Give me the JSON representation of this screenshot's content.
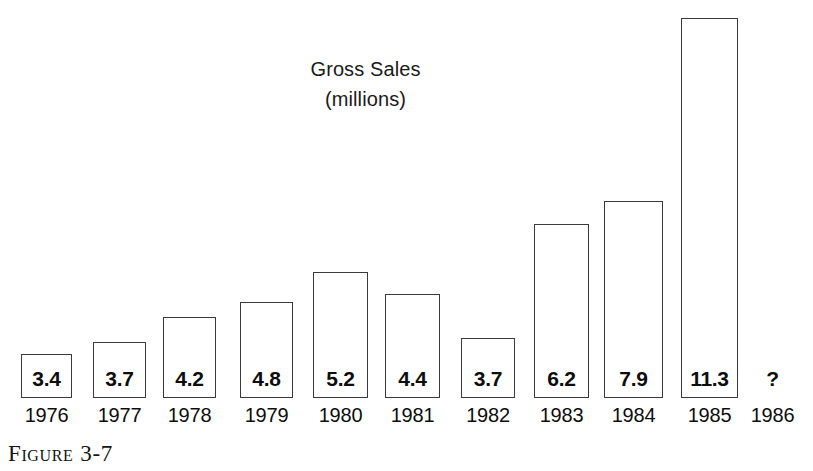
{
  "figure": {
    "caption_word": "Figure",
    "caption_number": "3-7"
  },
  "chart_data": {
    "type": "bar",
    "title": "Gross Sales",
    "subtitle": "(millions)",
    "xlabel": "",
    "ylabel": "",
    "ylim": [
      0,
      11.3
    ],
    "grid": false,
    "legend": null,
    "categories": [
      "1976",
      "1977",
      "1978",
      "1979",
      "1980",
      "1981",
      "1982",
      "1983",
      "1984",
      "1985",
      "1986"
    ],
    "values": [
      3.4,
      3.7,
      4.2,
      4.8,
      5.2,
      4.4,
      3.7,
      6.2,
      7.9,
      11.3,
      null
    ],
    "value_labels": [
      "3.4",
      "3.7",
      "4.2",
      "4.8",
      "5.2",
      "4.4",
      "3.7",
      "6.2",
      "7.9",
      "11.3",
      "?"
    ],
    "bars": [
      {
        "category": "1976",
        "value": 3.4,
        "label": "3.4",
        "x": 21,
        "width": 51,
        "top": 354,
        "has_bar": true
      },
      {
        "category": "1977",
        "value": 3.7,
        "label": "3.7",
        "x": 93,
        "width": 53,
        "top": 342,
        "has_bar": true
      },
      {
        "category": "1978",
        "value": 4.2,
        "label": "4.2",
        "x": 163,
        "width": 53,
        "top": 317,
        "has_bar": true
      },
      {
        "category": "1979",
        "value": 4.8,
        "label": "4.8",
        "x": 240,
        "width": 53,
        "top": 302,
        "has_bar": true
      },
      {
        "category": "1980",
        "value": 5.2,
        "label": "5.2",
        "x": 313,
        "width": 55,
        "top": 272,
        "has_bar": true
      },
      {
        "category": "1981",
        "value": 4.4,
        "label": "4.4",
        "x": 385,
        "width": 55,
        "top": 294,
        "has_bar": true
      },
      {
        "category": "1982",
        "value": 3.7,
        "label": "3.7",
        "x": 461,
        "width": 54,
        "top": 338,
        "has_bar": true
      },
      {
        "category": "1983",
        "value": 6.2,
        "label": "6.2",
        "x": 534,
        "width": 55,
        "top": 224,
        "has_bar": true
      },
      {
        "category": "1984",
        "value": 7.9,
        "label": "7.9",
        "x": 604,
        "width": 59,
        "top": 201,
        "has_bar": true
      },
      {
        "category": "1985",
        "value": 11.3,
        "label": "11.3",
        "x": 681,
        "width": 57,
        "top": 18,
        "has_bar": true
      },
      {
        "category": "1986",
        "value": null,
        "label": "?",
        "x": 750,
        "width": 45,
        "top": 360,
        "has_bar": false
      }
    ],
    "baseline_y": 398
  }
}
